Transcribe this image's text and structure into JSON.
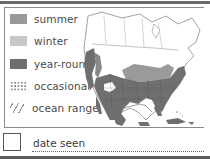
{
  "legend": {
    "items": [
      {
        "key": "summer",
        "label": "summer",
        "color": "#999999"
      },
      {
        "key": "winter",
        "label": "winter",
        "color": "#c8c8c8"
      },
      {
        "key": "year-round",
        "label": "year-round",
        "color": "#6f6f6f"
      },
      {
        "key": "occasional",
        "label": "occasional",
        "pattern": "dotted"
      },
      {
        "key": "ocean-range",
        "label": "ocean range",
        "pattern": "hatched"
      }
    ]
  },
  "map": {
    "region": "North America",
    "colors": {
      "land": "#ffffff",
      "borders": "#7a7a7a",
      "summer": "#9a9a9a",
      "year_round": "#6f6f6f"
    }
  },
  "footer": {
    "checkbox_checked": false,
    "date_label": "date seen",
    "date_value": ""
  }
}
